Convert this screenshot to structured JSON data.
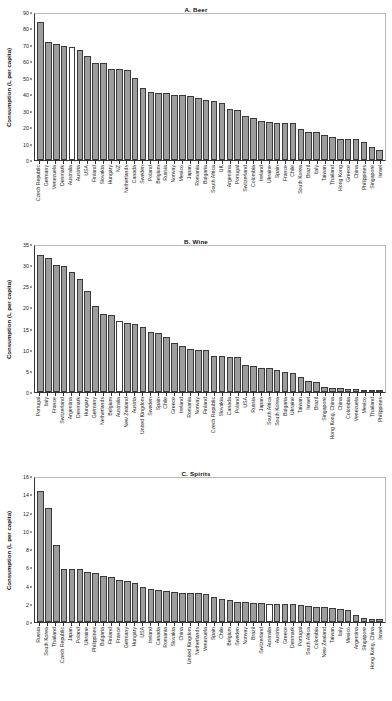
{
  "figure": {
    "y_axis_title": "Consumption (L per capita)",
    "highlight_country": "Australia",
    "highlight_color": "#ffffff",
    "bar_color": "#9d9d9d",
    "bar_edge_color": "#3a3a3a"
  },
  "chart_data": [
    {
      "type": "bar",
      "title": "A. Beer",
      "xlabel": "",
      "ylabel": "Consumption (L per capita)",
      "ylim": [
        0,
        90
      ],
      "yticks": [
        0,
        10,
        20,
        30,
        40,
        50,
        60,
        70,
        80,
        90
      ],
      "grid": false,
      "legend": "none",
      "highlighted": [
        "Australia"
      ],
      "categories": [
        "Czech Republic",
        "Germany",
        "Venezuela",
        "Denmark",
        "Australia",
        "Austria",
        "USA",
        "Finland",
        "Slovakia",
        "Hungary",
        "NZ",
        "Netherlands",
        "Canada",
        "Sweden",
        "Poland",
        "Belgium",
        "Russia",
        "Norway",
        "Mexico",
        "Japan",
        "Romania",
        "Bulgaria",
        "South Africa",
        "UK",
        "Argentina",
        "Portugal",
        "Switzerland",
        "Colombia",
        "Ireland",
        "Ukraine",
        "Spain",
        "France",
        "Chile",
        "South Korea",
        "Brazil",
        "Italy",
        "Taiwan",
        "Thailand",
        "Hong Kong",
        "Greece",
        "China",
        "Philippines",
        "Singapore",
        "Israel"
      ],
      "values": [
        84.0,
        71.5,
        70.8,
        69.5,
        69.0,
        67.0,
        63.5,
        59.0,
        58.8,
        55.5,
        55.5,
        54.5,
        50.0,
        44.0,
        41.5,
        40.8,
        40.5,
        39.8,
        39.8,
        38.8,
        38.0,
        36.8,
        36.0,
        34.8,
        31.0,
        30.3,
        27.0,
        25.5,
        23.5,
        23.0,
        22.5,
        22.5,
        22.3,
        19.0,
        17.0,
        16.8,
        15.5,
        14.3,
        13.0,
        13.0,
        13.0,
        10.8,
        8.0,
        5.8
      ]
    },
    {
      "type": "bar",
      "title": "B. Wine",
      "xlabel": "",
      "ylabel": "Consumption (L per capita)",
      "ylim": [
        0,
        35
      ],
      "yticks": [
        0,
        5,
        10,
        15,
        20,
        25,
        30,
        35
      ],
      "grid": false,
      "legend": "none",
      "highlighted": [
        "Australia"
      ],
      "categories": [
        "Portugal",
        "Italy",
        "France",
        "Switzerland",
        "Argentina",
        "Denmark",
        "Hungary",
        "Germany",
        "Netherlands",
        "Belgium",
        "Australia",
        "New Zealand",
        "Austria",
        "United Kingdom",
        "Sweden",
        "Spain",
        "Chile",
        "Greece",
        "Ireland",
        "Romania",
        "Norway",
        "Finland",
        "Czech Republic",
        "Slovakia",
        "Canada",
        "Poland",
        "USA",
        "Russia",
        "Japan",
        "South Africa",
        "South Korea",
        "Bulgaria",
        "Ukraine",
        "Taiwan",
        "Israel",
        "Brazil",
        "Singapore",
        "Hong Kong, China",
        "China",
        "Colombia",
        "Venezuela",
        "Mexico",
        "Thailand",
        "Philippines"
      ],
      "values": [
        32.3,
        31.7,
        30.0,
        29.9,
        28.4,
        26.8,
        23.9,
        20.3,
        18.5,
        18.2,
        16.7,
        16.4,
        16.1,
        15.4,
        14.2,
        13.9,
        13.0,
        11.5,
        10.9,
        10.1,
        10.0,
        9.9,
        8.6,
        8.4,
        8.3,
        8.2,
        6.5,
        6.1,
        5.7,
        5.6,
        5.2,
        4.7,
        4.4,
        3.5,
        2.7,
        2.4,
        1.1,
        1.0,
        1.0,
        0.7,
        0.6,
        0.4,
        0.2,
        0.2
      ]
    },
    {
      "type": "bar",
      "title": "C. Spirits",
      "xlabel": "",
      "ylabel": "Consumption (L per capita)",
      "ylim": [
        0,
        16
      ],
      "yticks": [
        0,
        2,
        4,
        6,
        8,
        10,
        12,
        14,
        16
      ],
      "grid": false,
      "legend": "none",
      "highlighted": [
        "Australia"
      ],
      "categories": [
        "Russia",
        "South Korea",
        "Thailand",
        "Czech Republic",
        "Japan",
        "Poland",
        "Ukraine",
        "Philippines",
        "Bulgaria",
        "Finland",
        "France",
        "Germany",
        "Hungary",
        "USA",
        "Ireland",
        "Canada",
        "Romania",
        "Slovakia",
        "China",
        "United Kingdom",
        "Netherlands",
        "Venezuela",
        "Spain",
        "Chile",
        "Belgium",
        "Sweden",
        "Norway",
        "Brazil",
        "Switzerland",
        "Australia",
        "Austria",
        "Greece",
        "Denmark",
        "Portugal",
        "South Africa",
        "Colombia",
        "New Zealand",
        "Taiwan",
        "Italy",
        "Mexico",
        "Argentina",
        "Singapore",
        "Hong Kong, China",
        "Israel"
      ],
      "values": [
        14.4,
        12.5,
        8.4,
        5.8,
        5.8,
        5.8,
        5.5,
        5.4,
        5.0,
        4.9,
        4.6,
        4.5,
        4.3,
        3.8,
        3.6,
        3.5,
        3.4,
        3.3,
        3.2,
        3.2,
        3.2,
        3.1,
        2.7,
        2.5,
        2.4,
        2.2,
        2.2,
        2.1,
        2.1,
        2.0,
        2.0,
        1.95,
        1.95,
        1.9,
        1.8,
        1.7,
        1.6,
        1.5,
        1.4,
        1.3,
        0.75,
        0.4,
        0.3,
        0.3
      ]
    }
  ]
}
